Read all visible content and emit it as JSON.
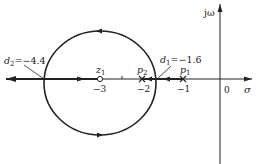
{
  "diagram": {
    "type": "root-locus",
    "axes": {
      "real_label": "σ",
      "imag_label": "jω",
      "origin_label": "0"
    },
    "ticks": [
      {
        "value": -3,
        "label": "−3"
      },
      {
        "value": -2,
        "label": "−2"
      },
      {
        "value": -1,
        "label": "−1"
      },
      {
        "value": 0,
        "label": "0"
      }
    ],
    "zeros": [
      {
        "name": "z",
        "sub": "1",
        "value": -3
      }
    ],
    "poles": [
      {
        "name": "p",
        "sub": "2",
        "value": -2
      },
      {
        "name": "p",
        "sub": "1",
        "value": -1
      }
    ],
    "breakpoints": [
      {
        "name": "d",
        "sub": "2",
        "text": "=−4.4",
        "value": -4.4
      },
      {
        "name": "d",
        "sub": "1",
        "text": "=−1.6",
        "value": -1.6
      }
    ],
    "circle": {
      "center": -3,
      "radius": 1.4
    },
    "colors": {
      "line": "#222222",
      "background": "#ffffff"
    }
  }
}
